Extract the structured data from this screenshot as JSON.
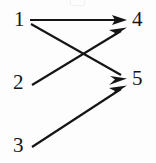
{
  "figure": {
    "title": "",
    "background_color": "#fdfdfd",
    "ink_color": "#151515",
    "width": 156,
    "height": 163
  },
  "nodes": [
    {
      "id": "1",
      "label": "1",
      "x": 14,
      "y": 10,
      "side": "left"
    },
    {
      "id": "2",
      "label": "2",
      "x": 13,
      "y": 72,
      "side": "left"
    },
    {
      "id": "3",
      "label": "3",
      "x": 13,
      "y": 135,
      "side": "left"
    },
    {
      "id": "4",
      "label": "4",
      "x": 132,
      "y": 9,
      "side": "right"
    },
    {
      "id": "5",
      "label": "5",
      "x": 132,
      "y": 69,
      "side": "right"
    }
  ],
  "edges": [
    {
      "id": "e1",
      "from": "1",
      "to": "4",
      "label": "",
      "x1": 30,
      "y1": 20,
      "x2": 126,
      "y2": 20,
      "arrow": true
    },
    {
      "id": "e2",
      "from": "1",
      "to": "5",
      "label": "",
      "x1": 31,
      "y1": 24,
      "x2": 126,
      "y2": 78,
      "arrow": true
    },
    {
      "id": "e3",
      "from": "2",
      "to": "4",
      "label": "",
      "x1": 32,
      "y1": 85,
      "x2": 126,
      "y2": 28,
      "arrow": true
    },
    {
      "id": "e4",
      "from": "3",
      "to": "5",
      "label": "",
      "x1": 32,
      "y1": 147,
      "x2": 126,
      "y2": 86,
      "arrow": true
    }
  ],
  "artifacts": [
    {
      "id": "top-clip",
      "description": "faint clipped glyph remnant at top edge"
    }
  ]
}
